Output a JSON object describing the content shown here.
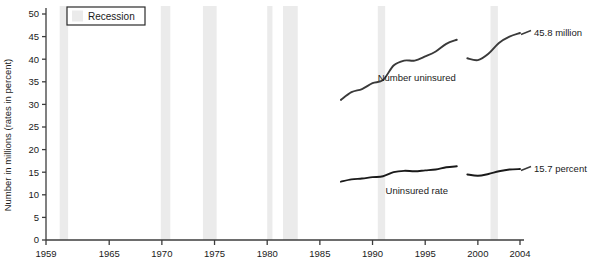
{
  "chart_data": {
    "type": "line",
    "title": "",
    "xlabel": "",
    "ylabel": "Number in millions (rates in percent)",
    "xlim": [
      1959,
      2004
    ],
    "ylim": [
      0,
      50
    ],
    "grid": false,
    "y_ticks": [
      0,
      5,
      10,
      15,
      20,
      25,
      30,
      35,
      40,
      45,
      50
    ],
    "y_tick_labels": [
      "0",
      "5",
      "10",
      "15",
      "20",
      "25",
      "30",
      "35",
      "40",
      "45",
      "50"
    ],
    "x_ticks": [
      1959,
      1965,
      1970,
      1975,
      1980,
      1985,
      1990,
      1995,
      2000,
      2004
    ],
    "x_tick_labels": [
      "1959",
      "1965",
      "1970",
      "1975",
      "1980",
      "1985",
      "1990",
      "1995",
      "2000",
      "2004"
    ],
    "legend": {
      "position": "top-left",
      "entries": [
        {
          "label": "Recession",
          "swatch_color": "#ebebeb",
          "swatch_type": "band"
        }
      ]
    },
    "series": [
      {
        "name": "Number uninsured",
        "units": "millions",
        "color": "#3a3a3a",
        "annotation_label": "Number uninsured",
        "end_value_label": "45.8 million",
        "end_value": 45.8,
        "segments": [
          {
            "x": [
              1987,
              1988,
              1989,
              1990,
              1991,
              1992,
              1993,
              1994,
              1995,
              1996,
              1997,
              1998
            ],
            "y": [
              31.0,
              32.7,
              33.4,
              34.7,
              35.4,
              38.6,
              39.7,
              39.7,
              40.6,
              41.7,
              43.4,
              44.3
            ]
          },
          {
            "x": [
              1999,
              2000,
              2001,
              2002,
              2003,
              2004
            ],
            "y": [
              40.2,
              39.8,
              41.2,
              43.6,
              45.0,
              45.8
            ]
          }
        ]
      },
      {
        "name": "Uninsured rate",
        "units": "percent",
        "color": "#1a1a1a",
        "annotation_label": "Uninsured rate",
        "end_value_label": "15.7 percent",
        "end_value": 15.7,
        "segments": [
          {
            "x": [
              1987,
              1988,
              1989,
              1990,
              1991,
              1992,
              1993,
              1994,
              1995,
              1996,
              1997,
              1998
            ],
            "y": [
              12.9,
              13.4,
              13.6,
              13.9,
              14.1,
              15.0,
              15.3,
              15.2,
              15.4,
              15.6,
              16.1,
              16.3
            ]
          },
          {
            "x": [
              1999,
              2000,
              2001,
              2002,
              2003,
              2004
            ],
            "y": [
              14.5,
              14.2,
              14.6,
              15.2,
              15.6,
              15.7
            ]
          }
        ]
      }
    ],
    "recession_bands": [
      {
        "start": 1960.3,
        "end": 1961.1
      },
      {
        "start": 1969.9,
        "end": 1970.8
      },
      {
        "start": 1973.9,
        "end": 1975.2
      },
      {
        "start": 1980.0,
        "end": 1980.5
      },
      {
        "start": 1981.5,
        "end": 1982.9
      },
      {
        "start": 1990.5,
        "end": 1991.2
      },
      {
        "start": 2001.2,
        "end": 2001.9
      }
    ],
    "annotations": [
      {
        "text": "Number uninsured",
        "x": 1994.2,
        "y": 36.0
      },
      {
        "text": "45.8 million",
        "x": 2005.0,
        "y": 45.8
      },
      {
        "text": "Uninsured rate",
        "x": 1994.2,
        "y": 11.0
      },
      {
        "text": "15.7 percent",
        "x": 2005.0,
        "y": 15.7
      }
    ],
    "colors": {
      "axis": "#3c3c3c",
      "recession_band": "#ebebeb",
      "line_number": "#3a3a3a",
      "line_rate": "#1a1a1a",
      "text": "#1a1a1a",
      "background": "#ffffff"
    }
  }
}
